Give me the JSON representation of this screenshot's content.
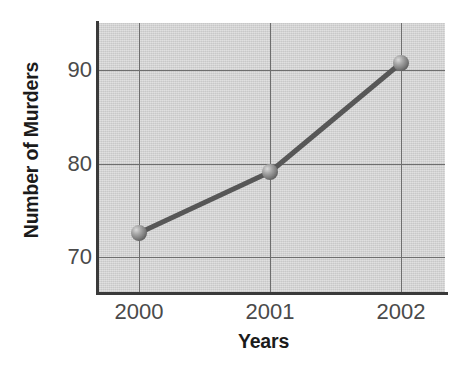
{
  "chart_data": {
    "type": "line",
    "title": "",
    "xlabel": "Years",
    "ylabel": "Number of Murders",
    "categories": [
      "2000",
      "2001",
      "2002"
    ],
    "x": [
      2000,
      2001,
      2002
    ],
    "values": [
      72.6,
      79.1,
      90.7
    ],
    "series": [
      {
        "name": "Number of Murders",
        "values": [
          72.6,
          79.1,
          90.7
        ]
      }
    ],
    "ytick_labels": [
      "90",
      "80",
      "70"
    ],
    "yticks": [
      90,
      80,
      70
    ],
    "xtick_labels": [
      "2000",
      "2001",
      "2002"
    ],
    "ylim": [
      66.2,
      94.9
    ],
    "xlim": [
      1999.7,
      2002.33
    ],
    "grid": true,
    "legend": "none",
    "marker": "sphere",
    "colors": {
      "plot_background": "#d6d6d6",
      "gridline": "#6e6e6e",
      "axis": "#3a3a3a",
      "series_line": "#575757",
      "marker_fill": "#8f8f8f",
      "tick_label": "#4a4a4a",
      "axis_title": "#1b1b1b",
      "page_background": "#ffffff"
    }
  },
  "axes": {
    "y_title": "Number of Murders",
    "x_title": "Years",
    "y_ticks": [
      {
        "label": "90",
        "top": 59
      },
      {
        "label": "80",
        "top": 153
      },
      {
        "label": "70",
        "top": 246
      }
    ],
    "x_ticks": [
      {
        "label": "2000",
        "left": 139
      },
      {
        "label": "2001",
        "left": 270
      },
      {
        "label": "2002",
        "left": 401
      }
    ]
  },
  "geometry": {
    "gridlines_y": [
      47,
      141,
      234
    ],
    "gridlines_x": [
      41,
      172,
      303
    ],
    "points": [
      {
        "cx": 41,
        "cy": 210,
        "label": "2000"
      },
      {
        "cx": 172,
        "cy": 149,
        "label": "2001"
      },
      {
        "cx": 303,
        "cy": 40,
        "label": "2002"
      }
    ],
    "polyline": "41,210 172,149 303,40"
  }
}
